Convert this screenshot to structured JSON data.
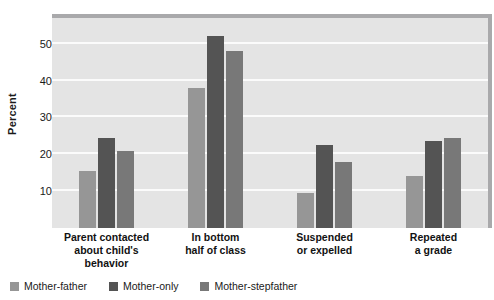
{
  "chart_data": {
    "type": "bar",
    "title": "",
    "subtitle": "",
    "xlabel": "",
    "ylabel": "Percent",
    "ylim": [
      0,
      57
    ],
    "yticks": [
      10,
      20,
      30,
      40,
      50
    ],
    "ytick_labels": [
      "10",
      "20",
      "30",
      "40",
      "50"
    ],
    "grid": true,
    "legend_position": "bottom-left",
    "categories": [
      "Parent contacted about child's behavior",
      "In bottom half of class",
      "Suspended or expelled",
      "Repeated a grade"
    ],
    "category_lines": [
      [
        "Parent contacted",
        "about child's",
        "behavior"
      ],
      [
        "In bottom",
        "half of class"
      ],
      [
        "Suspended",
        "or expelled"
      ],
      [
        "Repeated",
        "a grade"
      ]
    ],
    "series": [
      {
        "name": "Mother-father",
        "color": "#969696",
        "values": [
          15.5,
          38,
          9.5,
          14
        ]
      },
      {
        "name": "Mother-only",
        "color": "#545454",
        "values": [
          24.5,
          52,
          22.5,
          23.5
        ]
      },
      {
        "name": "Mother-stepfather",
        "color": "#787878",
        "values": [
          21,
          48,
          18,
          24.5
        ]
      }
    ],
    "plot_background": "#e4e4e4",
    "gridline_color": "#fbfbfb",
    "frame_color": "#a9a9ab"
  }
}
